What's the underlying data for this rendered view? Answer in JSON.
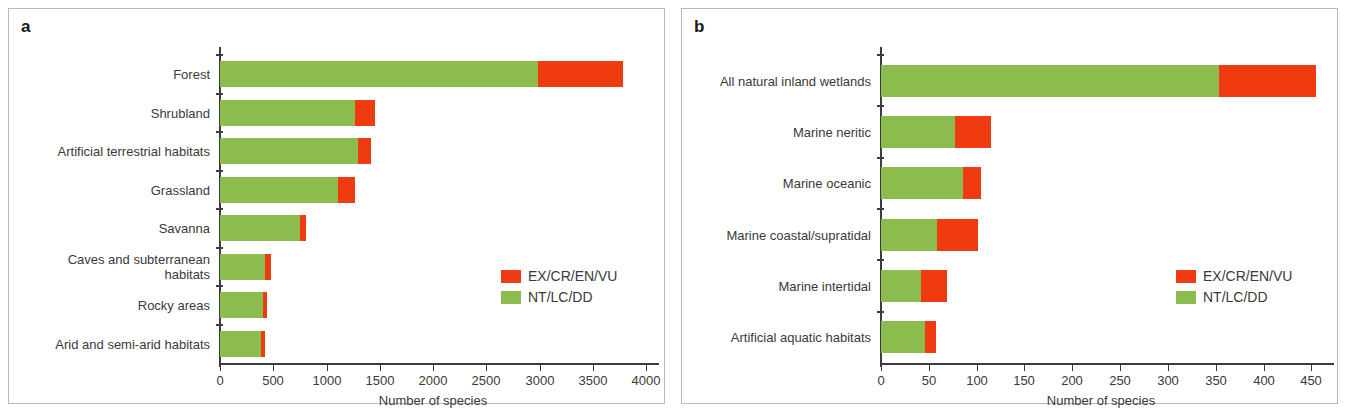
{
  "figure": {
    "background": "#ffffff",
    "colors": {
      "green": "#8dbc4e",
      "red": "#f03a10",
      "axis": "#3c3c3c",
      "text": "#3a3a3a"
    }
  },
  "panels": [
    {
      "letter": "a",
      "xlabel": "Number of species",
      "legend": [
        {
          "label": "EX/CR/EN/VU",
          "color": "#f03a10"
        },
        {
          "label": "NT/LC/DD",
          "color": "#8dbc4e"
        }
      ]
    },
    {
      "letter": "b",
      "xlabel": "Number of species",
      "legend": [
        {
          "label": "EX/CR/EN/VU",
          "color": "#f03a10"
        },
        {
          "label": "NT/LC/DD",
          "color": "#8dbc4e"
        }
      ]
    }
  ],
  "chart_data": [
    {
      "type": "bar",
      "orientation": "horizontal",
      "stacked": true,
      "panel": "a",
      "title": "",
      "xlabel": "Number of species",
      "ylabel": "",
      "xlim": [
        0,
        4000
      ],
      "xticks": [
        0,
        500,
        1000,
        1500,
        2000,
        2500,
        3000,
        3500,
        4000
      ],
      "xticklabels": [
        "0",
        "500",
        "1000",
        "1500",
        "2000",
        "2500",
        "3000",
        "3500",
        "4000"
      ],
      "grid": false,
      "legend_position": "right-middle",
      "categories": [
        "Forest",
        "Shrubland",
        "Artificial terrestrial habitats",
        "Grassland",
        "Savanna",
        "Caves and subterranean\nhabitats",
        "Rocky areas",
        "Arid and semi-arid habitats"
      ],
      "series": [
        {
          "name": "NT/LC/DD",
          "color": "#8dbc4e",
          "values": [
            2990,
            1265,
            1300,
            1110,
            750,
            420,
            405,
            385
          ]
        },
        {
          "name": "EX/CR/EN/VU",
          "color": "#f03a10",
          "values": [
            800,
            185,
            125,
            155,
            55,
            55,
            40,
            35
          ]
        }
      ],
      "totals": [
        3790,
        1450,
        1425,
        1265,
        805,
        475,
        445,
        420
      ]
    },
    {
      "type": "bar",
      "orientation": "horizontal",
      "stacked": true,
      "panel": "b",
      "title": "",
      "xlabel": "Number of species",
      "ylabel": "",
      "xlim": [
        0,
        460
      ],
      "xticks": [
        0,
        50,
        100,
        150,
        200,
        250,
        300,
        350,
        400,
        450
      ],
      "xticklabels": [
        "0",
        "50",
        "100",
        "150",
        "200",
        "250",
        "300",
        "350",
        "400",
        "450"
      ],
      "grid": false,
      "legend_position": "right-middle",
      "categories": [
        "All natural inland wetlands",
        "Marine neritic",
        "Marine oceanic",
        "Marine coastal/supratidal",
        "Marine intertidal",
        "Artificial aquatic habitats"
      ],
      "series": [
        {
          "name": "NT/LC/DD",
          "color": "#8dbc4e",
          "values": [
            353,
            77,
            86,
            59,
            42,
            46
          ]
        },
        {
          "name": "EX/CR/EN/VU",
          "color": "#f03a10",
          "values": [
            101,
            38,
            19,
            43,
            27,
            11
          ]
        }
      ],
      "totals": [
        454,
        115,
        105,
        102,
        69,
        57
      ]
    }
  ]
}
